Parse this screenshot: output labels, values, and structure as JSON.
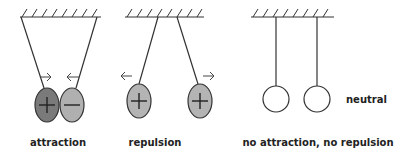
{
  "diagram": {
    "panels": [
      {
        "id": "attraction",
        "label": "attraction",
        "balls": [
          {
            "charge": "+",
            "fill": "#7a7a7a"
          },
          {
            "charge": "−",
            "fill": "#b0b0b0"
          }
        ],
        "arrows": [
          "→",
          "←"
        ]
      },
      {
        "id": "repulsion",
        "label": "repulsion",
        "balls": [
          {
            "charge": "+",
            "fill": "#b4b4b4"
          },
          {
            "charge": "+",
            "fill": "#b4b4b4"
          }
        ],
        "arrows": [
          "←",
          "→"
        ]
      },
      {
        "id": "neutral",
        "label": "no attraction, no repulsion",
        "side_label": "neutral",
        "balls": [
          {
            "charge": "",
            "fill": "#ffffff"
          },
          {
            "charge": "",
            "fill": "#ffffff"
          }
        ],
        "arrows": []
      }
    ],
    "colors": {
      "line": "#333333",
      "positive_dark": "#7a7a7a",
      "negative_light": "#b0b0b0",
      "repulsion_ball": "#b4b4b4",
      "neutral_ball": "#ffffff"
    }
  }
}
